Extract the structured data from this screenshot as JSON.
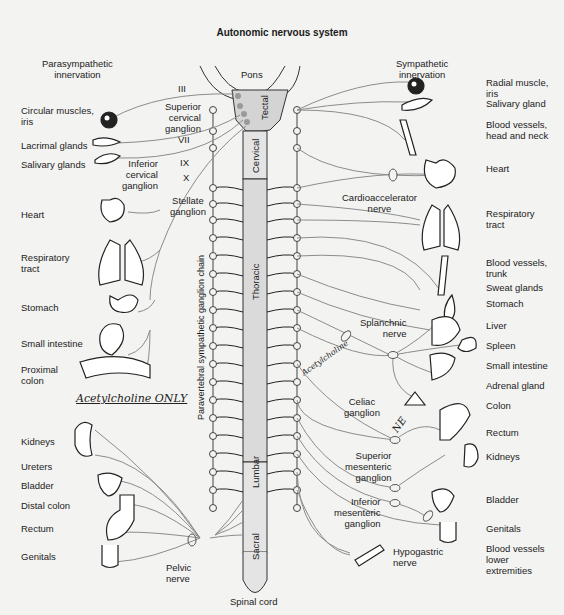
{
  "title": "Autonomic nervous system",
  "headings": {
    "parasympathetic": "Parasympathetic\ninnervation",
    "sympathetic": "Sympathetic\ninnervation"
  },
  "cord": {
    "pons": "Pons",
    "tectal": "Tectal",
    "cervical": "Cervical",
    "thoracic": "Thoracic",
    "lumbar": "Lumbar",
    "sacral": "Sacral",
    "spinal_cord": "Spinal cord",
    "chain": "Paravertebral sympathetic ganglion chain"
  },
  "cranial_nerves": [
    "III",
    "VII",
    "IX",
    "X"
  ],
  "left_organs": [
    "Circular muscles,\niris",
    "Lacrimal glands",
    "Salivary glands",
    "Heart",
    "Respiratory\ntract",
    "Stomach",
    "Small intestine",
    "Proximal\ncolon",
    "Kidneys",
    "Ureters",
    "Bladder",
    "Distal colon",
    "Rectum",
    "Genitals"
  ],
  "right_organs": [
    "Radial muscle,\niris",
    "Salivary gland",
    "Blood vessels,\nhead and neck",
    "Heart",
    "Respiratory\ntract",
    "Blood vessels,\ntrunk",
    "Sweat glands",
    "Stomach",
    "Liver",
    "Spleen",
    "Small intestine",
    "Adrenal gland",
    "Colon",
    "Rectum",
    "Kidneys",
    "Bladder",
    "Genitals",
    "Blood vessels\nlower\nextremities"
  ],
  "ganglia": {
    "superior_cervical": "Superior\ncervical\nganglion",
    "inferior_cervical": "Inferior\ncervical\nganglion",
    "stellate": "Stellate\nganglion",
    "cardioaccelerator": "Cardioaccelerator\nnerve",
    "splanchnic": "Splanchnic\nnerve",
    "celiac": "Celiac\nganglion",
    "superior_mesenteric": "Superior\nmesenteric\nganglion",
    "inferior_mesenteric": "Inferior\nmesenteric\nganglion",
    "hypogastric": "Hypogastric\nnerve",
    "pelvic": "Pelvic\nnerve"
  },
  "annotations": {
    "acetylcholine_only": "Acetylcholine ONLY",
    "acetylcholine": "Acetylcholine",
    "ne": "NE"
  }
}
